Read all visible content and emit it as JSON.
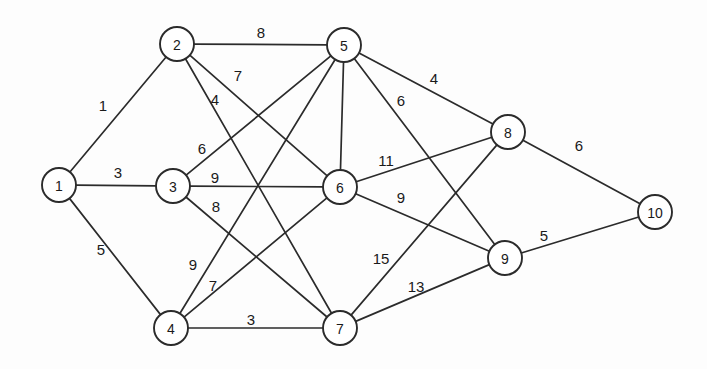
{
  "diagram": {
    "type": "node-link-graph",
    "canvas": {
      "width": 707,
      "height": 369,
      "background": "#fdfdfd"
    },
    "style": {
      "node_fill": "#ffffff",
      "node_stroke": "#2b2b2b",
      "edge_stroke": "#2b2b2b",
      "label_color": "#1a1a1a",
      "node_radius": 17
    },
    "nodes": [
      {
        "id": "1",
        "label": "1",
        "x": 59,
        "y": 185
      },
      {
        "id": "2",
        "label": "2",
        "x": 177,
        "y": 44
      },
      {
        "id": "3",
        "label": "3",
        "x": 173,
        "y": 186
      },
      {
        "id": "4",
        "label": "4",
        "x": 171,
        "y": 328
      },
      {
        "id": "5",
        "label": "5",
        "x": 344,
        "y": 45
      },
      {
        "id": "6",
        "label": "6",
        "x": 340,
        "y": 187
      },
      {
        "id": "7",
        "label": "7",
        "x": 340,
        "y": 328
      },
      {
        "id": "8",
        "label": "8",
        "x": 508,
        "y": 132
      },
      {
        "id": "9",
        "label": "9",
        "x": 505,
        "y": 258
      },
      {
        "id": "10",
        "label": "10",
        "x": 655,
        "y": 212
      }
    ],
    "edges": [
      {
        "source": "1",
        "target": "2",
        "weight": "1",
        "lx": 103,
        "ly": 105
      },
      {
        "source": "1",
        "target": "3",
        "weight": "3",
        "lx": 118,
        "ly": 172
      },
      {
        "source": "1",
        "target": "4",
        "weight": "5",
        "lx": 101,
        "ly": 249
      },
      {
        "source": "2",
        "target": "5",
        "weight": "8",
        "lx": 261,
        "ly": 32
      },
      {
        "source": "2",
        "target": "6",
        "weight": "7",
        "lx": 238,
        "ly": 75
      },
      {
        "source": "2",
        "target": "7",
        "weight": "4",
        "lx": 215,
        "ly": 99
      },
      {
        "source": "3",
        "target": "5",
        "weight": "6",
        "lx": 202,
        "ly": 148
      },
      {
        "source": "3",
        "target": "6",
        "weight": "9",
        "lx": 215,
        "ly": 177
      },
      {
        "source": "3",
        "target": "7",
        "weight": "8",
        "lx": 216,
        "ly": 206
      },
      {
        "source": "4",
        "target": "5",
        "weight": "9",
        "lx": 193,
        "ly": 264
      },
      {
        "source": "4",
        "target": "6",
        "weight": "7",
        "lx": 213,
        "ly": 285
      },
      {
        "source": "4",
        "target": "7",
        "weight": "3",
        "lx": 251,
        "ly": 319
      },
      {
        "source": "5",
        "target": "6",
        "weight": "6",
        "lx": 401,
        "ly": 100
      },
      {
        "source": "5",
        "target": "8",
        "weight": "4",
        "lx": 434,
        "ly": 78
      },
      {
        "source": "5",
        "target": "9",
        "weight": "",
        "lx": 0,
        "ly": 0
      },
      {
        "source": "6",
        "target": "8",
        "weight": "11",
        "lx": 386,
        "ly": 160
      },
      {
        "source": "6",
        "target": "9",
        "weight": "9",
        "lx": 401,
        "ly": 197
      },
      {
        "source": "7",
        "target": "8",
        "weight": "15",
        "lx": 381,
        "ly": 258
      },
      {
        "source": "7",
        "target": "9",
        "weight": "13",
        "lx": 416,
        "ly": 286
      },
      {
        "source": "8",
        "target": "10",
        "weight": "6",
        "lx": 579,
        "ly": 145
      },
      {
        "source": "9",
        "target": "10",
        "weight": "5",
        "lx": 544,
        "ly": 235
      }
    ]
  }
}
